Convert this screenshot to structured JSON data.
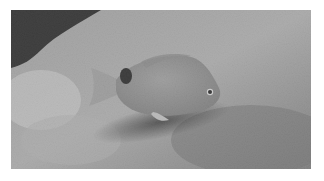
{
  "image": {
    "subject": "fish",
    "description": "Grayscale photograph of a small fish with a dark spot near the tail, resting over a textured rocky seabed",
    "colors": {
      "background": "#ffffff",
      "rock_light": "#c8c8c8",
      "rock_mid": "#8f8f8f",
      "shadow_dark": "#1a1a1a",
      "fish_body": "#9a9a9a",
      "fish_spot": "#141414"
    }
  }
}
